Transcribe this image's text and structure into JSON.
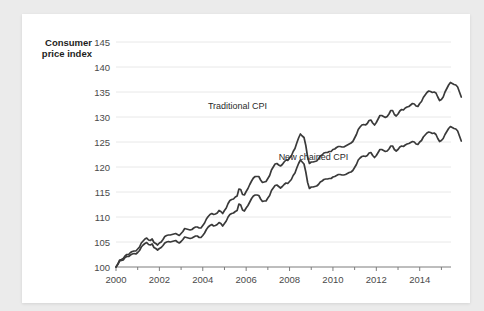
{
  "chart_data": {
    "type": "line",
    "title": "",
    "xlabel": "",
    "ylabel": "Consumer price index",
    "ylabel_line1": "Consumer",
    "ylabel_line2": "price index",
    "xlim": [
      2000.0,
      2015.35
    ],
    "ylim": [
      100,
      145
    ],
    "grid": true,
    "legend_position": "inline-annotation",
    "ytick_labels": [
      "100",
      "105",
      "110",
      "115",
      "120",
      "125",
      "130",
      "135",
      "140",
      "145"
    ],
    "ytick_values": [
      100,
      105,
      110,
      115,
      120,
      125,
      130,
      135,
      140,
      145
    ],
    "xtick_labels": [
      "2000",
      "2002",
      "2004",
      "2006",
      "2008",
      "2010",
      "2012",
      "2014"
    ],
    "xtick_values": [
      2000,
      2002,
      2004,
      2006,
      2008,
      2010,
      2012,
      2014
    ],
    "xminor_values": [
      2001,
      2003,
      2005,
      2007,
      2009,
      2011,
      2013,
      2015
    ],
    "line_color": "#3a3a3a",
    "gridline_color": "#e8e8e8",
    "axis_color": "#7d7d7d",
    "annotations": [
      {
        "text": "Traditional CPI",
        "x": 2005.6,
        "y": 131.6,
        "series": "Traditional CPI"
      },
      {
        "text": "New chained CPI",
        "x": 2009.1,
        "y": 121.5,
        "series": "New chained CPI"
      }
    ],
    "series": [
      {
        "name": "Traditional CPI",
        "x_start": 2000.0,
        "x_step": 0.08333,
        "values": [
          100.0,
          100.6,
          101.4,
          101.5,
          101.7,
          102.2,
          102.5,
          102.5,
          102.9,
          103.1,
          103.2,
          103.2,
          103.6,
          104.0,
          104.8,
          105.2,
          105.6,
          105.8,
          105.4,
          105.3,
          105.6,
          104.9,
          104.7,
          104.4,
          104.8,
          105.0,
          105.5,
          106.1,
          106.3,
          106.4,
          106.4,
          106.5,
          106.6,
          106.7,
          106.5,
          106.3,
          106.7,
          107.1,
          107.7,
          107.6,
          107.5,
          107.4,
          107.5,
          107.8,
          108.0,
          108.0,
          107.8,
          107.8,
          108.3,
          108.8,
          109.6,
          110.1,
          110.5,
          110.7,
          110.5,
          110.6,
          110.8,
          111.3,
          111.1,
          110.7,
          111.3,
          111.8,
          112.7,
          113.3,
          113.5,
          113.6,
          114.0,
          114.2,
          115.6,
          115.5,
          114.5,
          114.4,
          115.1,
          115.7,
          116.5,
          117.2,
          117.8,
          118.1,
          118.1,
          118.1,
          117.4,
          116.9,
          117.0,
          117.1,
          117.7,
          118.3,
          119.4,
          120.0,
          120.6,
          120.7,
          120.4,
          120.2,
          120.5,
          121.0,
          121.4,
          121.3,
          121.8,
          122.2,
          123.1,
          123.7,
          124.8,
          125.8,
          126.6,
          126.2,
          125.9,
          124.3,
          122.0,
          120.7,
          121.0,
          121.0,
          121.1,
          121.2,
          121.6,
          122.2,
          122.4,
          122.8,
          122.9,
          122.9,
          123.1,
          123.1,
          123.5,
          123.6,
          123.9,
          124.1,
          124.1,
          124.0,
          124.0,
          124.2,
          124.4,
          124.6,
          124.8,
          125.1,
          125.8,
          126.5,
          127.5,
          128.0,
          128.4,
          128.5,
          128.4,
          128.7,
          129.3,
          129.4,
          128.8,
          128.4,
          128.9,
          129.6,
          130.3,
          130.3,
          130.1,
          129.9,
          130.1,
          130.6,
          131.3,
          131.3,
          130.5,
          130.2,
          130.6,
          131.2,
          131.5,
          131.4,
          131.8,
          132.0,
          132.1,
          132.4,
          132.7,
          132.6,
          132.2,
          132.1,
          132.7,
          133.1,
          133.9,
          134.4,
          134.9,
          135.2,
          135.1,
          134.9,
          135.0,
          134.8,
          134.0,
          133.3,
          133.5,
          134.0,
          135.0,
          135.7,
          136.4,
          136.9,
          136.7,
          136.5,
          136.4,
          136.0,
          135.0,
          134.0
        ]
      },
      {
        "name": "New chained CPI",
        "x_start": 2000.0,
        "x_step": 0.08333,
        "values": [
          100.0,
          100.5,
          101.2,
          101.3,
          101.4,
          101.9,
          102.1,
          102.1,
          102.4,
          102.6,
          102.7,
          102.6,
          102.9,
          103.3,
          104.0,
          104.4,
          104.7,
          104.9,
          104.5,
          104.4,
          104.6,
          103.9,
          103.7,
          103.4,
          103.7,
          103.9,
          104.3,
          104.8,
          105.0,
          105.1,
          105.0,
          105.1,
          105.2,
          105.3,
          105.0,
          104.8,
          105.1,
          105.5,
          106.0,
          105.9,
          105.8,
          105.7,
          105.8,
          106.0,
          106.2,
          106.2,
          105.9,
          105.9,
          106.3,
          106.8,
          107.5,
          108.0,
          108.3,
          108.5,
          108.2,
          108.3,
          108.5,
          108.9,
          108.7,
          108.2,
          108.7,
          109.2,
          110.0,
          110.5,
          110.7,
          110.8,
          111.1,
          111.3,
          112.6,
          112.4,
          111.4,
          111.2,
          111.8,
          112.3,
          113.0,
          113.7,
          114.2,
          114.4,
          114.4,
          114.3,
          113.6,
          113.1,
          113.2,
          113.2,
          113.8,
          114.3,
          115.3,
          115.8,
          116.3,
          116.4,
          116.1,
          115.8,
          116.1,
          116.5,
          116.8,
          116.7,
          117.1,
          117.5,
          118.3,
          118.8,
          119.8,
          120.7,
          121.4,
          121.0,
          120.6,
          119.0,
          116.9,
          115.7,
          116.0,
          116.0,
          116.1,
          116.2,
          116.5,
          117.0,
          117.2,
          117.5,
          117.6,
          117.6,
          117.7,
          117.7,
          118.0,
          118.1,
          118.3,
          118.5,
          118.5,
          118.4,
          118.4,
          118.5,
          118.7,
          118.9,
          119.0,
          119.3,
          119.9,
          120.5,
          121.4,
          121.8,
          122.1,
          122.2,
          122.1,
          122.3,
          122.8,
          122.9,
          122.3,
          121.9,
          122.3,
          122.9,
          123.5,
          123.5,
          123.3,
          123.1,
          123.2,
          123.6,
          124.2,
          124.2,
          123.5,
          123.2,
          123.5,
          124.0,
          124.2,
          124.1,
          124.4,
          124.6,
          124.7,
          124.9,
          125.1,
          125.0,
          124.6,
          124.5,
          125.0,
          125.3,
          126.0,
          126.4,
          126.8,
          127.0,
          126.9,
          126.7,
          126.8,
          126.5,
          125.7,
          125.1,
          125.3,
          125.7,
          126.5,
          127.1,
          127.7,
          128.1,
          127.9,
          127.7,
          127.6,
          127.2,
          126.2,
          125.2
        ]
      }
    ]
  }
}
